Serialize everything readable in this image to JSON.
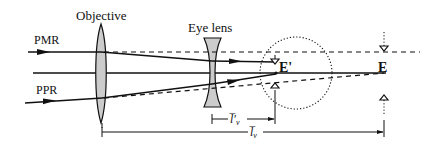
{
  "diagram": {
    "labels": {
      "objective": "Objective",
      "eye_lens": "Eye lens",
      "pmr": "PMR",
      "ppr": "PPR",
      "exit_pupil_virtual": "E'",
      "exit_pupil": "E",
      "dim_short": "l̅′",
      "dim_short_sub": "v",
      "dim_long": "l̅",
      "dim_long_sub": "v"
    },
    "colors": {
      "line": "#111111",
      "lens_fill": "#cccccc",
      "background": "#ffffff"
    }
  }
}
